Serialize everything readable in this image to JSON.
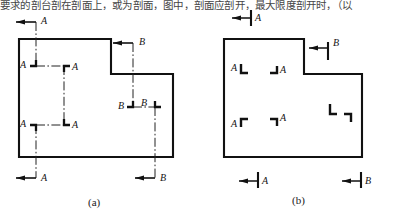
{
  "figure": {
    "top_text": "要求的剖台剖在剖面上，或为剖面，图中，剖面应剖开，最大限度剖开时，（以",
    "caption_a": "(a)",
    "caption_b": "(b)",
    "line_color": "#111111",
    "section_line_color": "#222222",
    "background": "#ffffff"
  },
  "diagram_a": {
    "name": "stepped-section-full-cutting-plane",
    "outline_label": "L-shaped part outline",
    "section_lines": [
      {
        "id": "A-A",
        "label": "A",
        "type": "stepped-offset-section",
        "arrow_labels": [
          "A",
          "A"
        ],
        "corner_labels": [
          "A",
          "A",
          "A",
          "A"
        ]
      },
      {
        "id": "B-B",
        "label": "B",
        "type": "stepped-offset-section",
        "arrow_labels": [
          "B",
          "B"
        ],
        "corner_labels": [
          "B",
          "B"
        ]
      }
    ],
    "labels": {
      "a_top_arrow": "A",
      "a_bottom_arrow": "A",
      "a_corner_tl": "A",
      "a_corner_tr": "A",
      "a_corner_bl": "A",
      "a_corner_br": "A",
      "b_top_arrow": "B",
      "b_bottom_arrow": "B",
      "b_corner_l": "B",
      "b_corner_r": "B"
    }
  },
  "diagram_b": {
    "name": "stepped-section-short-cutting-plane",
    "outline_label": "L-shaped part outline",
    "section_lines": [
      {
        "id": "A-A",
        "label": "A",
        "type": "stepped-offset-section-short-marks",
        "arrow_labels": [
          "A",
          "A"
        ],
        "corner_labels": [
          "A",
          "A",
          "A",
          "A"
        ]
      },
      {
        "id": "B-B",
        "label": "B",
        "type": "stepped-offset-section-short-marks",
        "arrow_labels": [
          "B",
          "B"
        ],
        "corner_labels": [
          "",
          ""
        ]
      }
    ],
    "labels": {
      "a_top_arrow": "A",
      "a_bottom_arrow": "A",
      "a_corner_tl": "A",
      "a_corner_tr": "A",
      "a_corner_bl": "A",
      "a_corner_br": "A",
      "b_top_arrow": "B",
      "b_bottom_arrow": "B"
    }
  }
}
